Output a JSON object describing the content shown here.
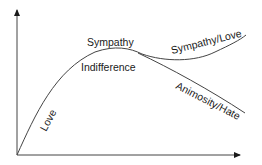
{
  "diagram": {
    "type": "conceptual-curve",
    "axes": {
      "x_axis": {
        "label": "",
        "arrow": true
      },
      "y_axis": {
        "label": "",
        "arrow": true
      }
    },
    "labels": {
      "love": "Love",
      "sympathy": "Sympathy",
      "indifference": "Indifference",
      "sympathy_love": "Sympathy/Love",
      "animosity_hate": "Animosity/Hate"
    },
    "colors": {
      "line": "#333333",
      "text": "#1a1a1a",
      "background": "#ffffff"
    }
  }
}
